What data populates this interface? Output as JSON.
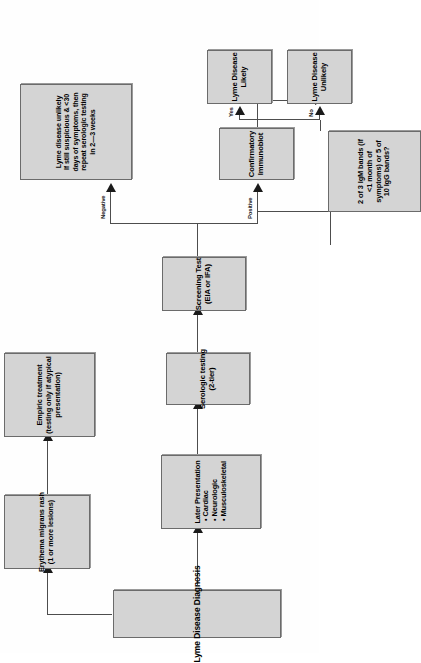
{
  "diagram": {
    "orientation": "rotated-90-ccw",
    "fill_color": "#d4d4d4",
    "border_color": "#6b6b6b",
    "line_color": "#4d4d4d"
  },
  "nodes": {
    "start": {
      "lines": [
        "Lyme Disease Diagnosis"
      ]
    },
    "erythema": {
      "lines": [
        "Erythema migrans rash",
        "(1 or more lesions)"
      ]
    },
    "empiric": {
      "lines": [
        "Empiric treatment",
        "(testing only if atypical",
        "presentation)"
      ]
    },
    "later_presentation": {
      "title": "Later Presentation",
      "bullets": [
        "• Cardiac",
        "• Neurologic",
        "• Musculoskeletal"
      ]
    },
    "serologic": {
      "lines": [
        "Serologic testing",
        "(2-tier)"
      ]
    },
    "screening": {
      "lines": [
        "Screening Test",
        "(EIA or IFA)"
      ]
    },
    "unlikely_repeat": {
      "lines": [
        "Lyme disease unlikely",
        "If still suspicious & <30",
        "days of symptoms, then",
        "repeat serologic testing",
        "in 2—3 weeks"
      ]
    },
    "immunoblot": {
      "lines": [
        "Confirmatory",
        "Immunoblot"
      ]
    },
    "bands": {
      "lines": [
        "2 of 3 IgM bands (if",
        "<1 month of",
        "symptoms) or 5 of",
        "10 IgG bands?"
      ]
    },
    "likely": {
      "lines": [
        "Lyme Disease",
        "Likely"
      ]
    },
    "unlikely": {
      "lines": [
        "Lyme Disease",
        "Unlikely"
      ]
    }
  },
  "edge_labels": {
    "negative": "Negative",
    "positive": "Positive",
    "yes": "Yes",
    "no": "No"
  }
}
